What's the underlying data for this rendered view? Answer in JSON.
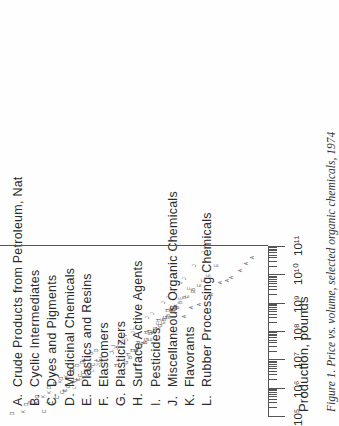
{
  "legend": {
    "items": [
      {
        "key": "A.",
        "label": "Crude Products from Petroleum, Nat"
      },
      {
        "key": "B.",
        "label": "Cyclic Intermediates"
      },
      {
        "key": "C.",
        "label": "Dyes and Pigments"
      },
      {
        "key": "D.",
        "label": "Medicinal Chemicals"
      },
      {
        "key": "E.",
        "label": "Plastics and Resins"
      },
      {
        "key": "F.",
        "label": "Elastomers"
      },
      {
        "key": "G.",
        "label": "Plasticizers"
      },
      {
        "key": "H.",
        "label": "Surface Active Agents"
      },
      {
        "key": "I.",
        "label": "Pesticides"
      },
      {
        "key": "J.",
        "label": "Miscellaneous Organic Chemicals"
      },
      {
        "key": "K.",
        "label": "Flavorants"
      },
      {
        "key": "L.",
        "label": "Rubber Processing Chemicals"
      }
    ]
  },
  "axis": {
    "title": "Production, pounds",
    "tick_labels": [
      "10⁵",
      "10⁶",
      "10⁷",
      "10⁸",
      "10⁹",
      "10¹⁰",
      "10¹¹"
    ]
  },
  "caption": {
    "text": "Figure 1.   Price vs. volume, selected organic chemicals, 1974"
  },
  "colors": {
    "ink": "#2a2a2a",
    "rule": "#555555",
    "marker": "#4a4a4a",
    "page": "#fefefe"
  },
  "chart_data": {
    "type": "scatter",
    "title": "Price vs. volume, selected organic chemicals, 1974",
    "xlabel": "Production, pounds",
    "ylabel": "Price",
    "xscale": "log",
    "yscale": "log",
    "xlim": [
      100000,
      100000000000
    ],
    "xticks": [
      100000,
      1000000,
      10000000,
      100000000,
      1000000000,
      10000000000,
      100000000000
    ],
    "grid": false,
    "legend_position": "above-plot",
    "marker_encoding": "letter-code",
    "note": "Each point is plotted as its category letter A-L. Price axis is cropped off the scanned page; y values are relative positions read from the plot.",
    "series": [
      {
        "name": "A. Crude Products from Petroleum, Nat",
        "letter": "A",
        "points": [
          [
            320000000.0,
            0.3
          ],
          [
            900000000.0,
            0.22
          ],
          [
            2000000000.0,
            0.17
          ],
          [
            6000000000.0,
            0.12
          ],
          [
            14000000000.0,
            0.09
          ],
          [
            40000000000.0,
            0.07
          ],
          [
            700000000.0,
            0.26
          ],
          [
            5000000000.0,
            0.14
          ],
          [
            24000000000.0,
            0.08
          ],
          [
            8000000000.0,
            0.11
          ]
        ]
      },
      {
        "name": "B. Cyclic Intermediates",
        "letter": "B",
        "points": [
          [
            12000000.0,
            0.95
          ],
          [
            40000000.0,
            0.7
          ],
          [
            90000000.0,
            0.58
          ],
          [
            250000000.0,
            0.46
          ],
          [
            600000000.0,
            0.38
          ],
          [
            1500000000.0,
            0.3
          ],
          [
            3000000000.0,
            0.25
          ],
          [
            80000000.0,
            0.62
          ],
          [
            350000000.0,
            0.42
          ],
          [
            1000000000.0,
            0.33
          ],
          [
            20000000.0,
            0.85
          ],
          [
            550000000.0,
            0.4
          ]
        ]
      },
      {
        "name": "C. Dyes and Pigments",
        "letter": "C",
        "points": [
          [
            150000.0,
            6.1
          ],
          [
            280000.0,
            5.2
          ],
          [
            450000.0,
            4.6
          ],
          [
            700000.0,
            4.1
          ],
          [
            1100000.0,
            3.6
          ],
          [
            1800000.0,
            3.1
          ],
          [
            2600000.0,
            2.8
          ],
          [
            4000000.0,
            2.45
          ],
          [
            6500000.0,
            2.1
          ],
          [
            9000000.0,
            1.9
          ],
          [
            300000.0,
            4.9
          ],
          [
            800000.0,
            3.85
          ],
          [
            2000000.0,
            2.95
          ],
          [
            5000000.0,
            2.25
          ],
          [
            1300000.0,
            3.4
          ],
          [
            3400000.0,
            2.6
          ]
        ]
      },
      {
        "name": "D. Medicinal Chemicals",
        "letter": "D",
        "points": [
          [
            120000.0,
            12.0
          ],
          [
            250000.0,
            9.0
          ],
          [
            500000.0,
            7.0
          ],
          [
            1000000.0,
            5.4
          ],
          [
            2200000.0,
            4.2
          ],
          [
            4500000.0,
            3.3
          ],
          [
            8000000.0,
            2.7
          ],
          [
            16000000.0,
            2.2
          ],
          [
            300000.0,
            8.2
          ],
          [
            1400000.0,
            4.8
          ],
          [
            6000000.0,
            3.0
          ],
          [
            20000000.0,
            2.0
          ]
        ]
      },
      {
        "name": "E. Plastics and Resins",
        "letter": "E",
        "points": [
          [
            50000000.0,
            0.62
          ],
          [
            120000000.0,
            0.52
          ],
          [
            300000000.0,
            0.42
          ],
          [
            700000000.0,
            0.35
          ],
          [
            1600000000.0,
            0.28
          ],
          [
            4000000000.0,
            0.22
          ],
          [
            9000000000.0,
            0.18
          ],
          [
            20000000000.0,
            0.15
          ],
          [
            200000000.0,
            0.47
          ],
          [
            500000000.0,
            0.38
          ],
          [
            2500000000.0,
            0.25
          ],
          [
            6000000000.0,
            0.2
          ]
        ]
      },
      {
        "name": "F. Elastomers",
        "letter": "F",
        "points": [
          [
            40000000.0,
            0.7
          ],
          [
            100000000.0,
            0.58
          ],
          [
            260000000.0,
            0.48
          ],
          [
            600000000.0,
            0.4
          ],
          [
            1400000000.0,
            0.33
          ],
          [
            3200000000.0,
            0.27
          ],
          [
            800000000.0,
            0.36
          ],
          [
            180000000.0,
            0.52
          ]
        ]
      },
      {
        "name": "G. Plasticizers",
        "letter": "G",
        "points": [
          [
            8000000.0,
            1.05
          ],
          [
            20000000.0,
            0.85
          ],
          [
            50000000.0,
            0.68
          ],
          [
            120000000.0,
            0.56
          ],
          [
            300000000.0,
            0.45
          ],
          [
            700000000.0,
            0.37
          ],
          [
            35000000.0,
            0.75
          ],
          [
            160000000.0,
            0.5
          ]
        ]
      },
      {
        "name": "H. Surface Active Agents",
        "letter": "H",
        "points": [
          [
            6000000.0,
            1.3
          ],
          [
            15000000.0,
            1.0
          ],
          [
            40000000.0,
            0.8
          ],
          [
            100000000.0,
            0.64
          ],
          [
            240000000.0,
            0.52
          ],
          [
            550000000.0,
            0.43
          ],
          [
            90000000.0,
            0.68
          ],
          [
            20000000.0,
            0.92
          ]
        ]
      },
      {
        "name": "I. Pesticides",
        "letter": "I",
        "points": [
          [
            300000.0,
            5.4
          ],
          [
            800000.0,
            3.9
          ],
          [
            2000000.0,
            2.9
          ],
          [
            5000000.0,
            2.2
          ],
          [
            12000000.0,
            1.75
          ],
          [
            30000000.0,
            1.35
          ],
          [
            70000000.0,
            1.05
          ],
          [
            1500000.0,
            3.2
          ],
          [
            9000000.0,
            1.95
          ]
        ]
      },
      {
        "name": "J. Miscellaneous Organic Chemicals",
        "letter": "J",
        "points": [
          [
            2000000.0,
            2.6
          ],
          [
            6000000.0,
            1.9
          ],
          [
            18000000.0,
            1.4
          ],
          [
            50000000.0,
            1.05
          ],
          [
            140000000.0,
            0.8
          ],
          [
            400000000.0,
            0.6
          ],
          [
            1000000000.0,
            0.47
          ],
          [
            2600000000.0,
            0.38
          ],
          [
            7000000000.0,
            0.3
          ],
          [
            20000000000.0,
            0.24
          ],
          [
            90000000.0,
            0.9
          ],
          [
            300000000.0,
            0.66
          ],
          [
            1500000000.0,
            0.42
          ],
          [
            5000000000.0,
            0.33
          ],
          [
            8000000.0,
            1.7
          ],
          [
            35000000.0,
            1.18
          ],
          [
            60000000000.0,
            0.2
          ],
          [
            25000000.0,
            1.3
          ]
        ]
      },
      {
        "name": "K. Flavorants",
        "letter": "K",
        "points": [
          [
            140000.0,
            9.5
          ],
          [
            300000.0,
            7.2
          ],
          [
            700000.0,
            5.5
          ],
          [
            1600000.0,
            4.3
          ],
          [
            4000000.0,
            3.3
          ],
          [
            9000000.0,
            2.6
          ],
          [
            500000.0,
            6.2
          ],
          [
            2400000.0,
            3.8
          ]
        ]
      },
      {
        "name": "L. Rubber Processing Chemicals",
        "letter": "L",
        "points": [
          [
            1000000.0,
            3.2
          ],
          [
            3000000.0,
            2.4
          ],
          [
            8000000.0,
            1.85
          ],
          [
            20000000.0,
            1.45
          ],
          [
            50000000.0,
            1.15
          ],
          [
            120000000.0,
            0.92
          ],
          [
            4000000.0,
            2.15
          ],
          [
            30000000.0,
            1.3
          ]
        ]
      }
    ]
  }
}
